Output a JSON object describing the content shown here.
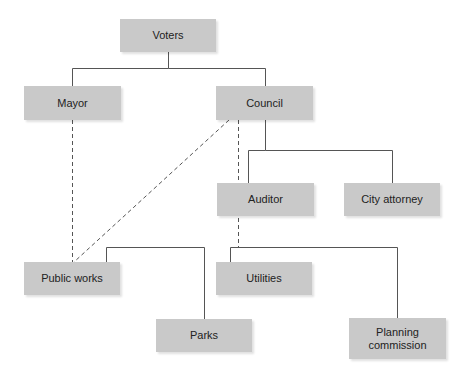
{
  "diagram": {
    "type": "org-chart",
    "nodes": [
      {
        "id": "voters",
        "label": "Voters",
        "x": 120,
        "y": 19,
        "w": 96,
        "h": 33
      },
      {
        "id": "mayor",
        "label": "Mayor",
        "x": 24,
        "y": 86,
        "w": 97,
        "h": 34
      },
      {
        "id": "council",
        "label": "Council",
        "x": 216,
        "y": 86,
        "w": 97,
        "h": 34
      },
      {
        "id": "auditor",
        "label": "Auditor",
        "x": 217,
        "y": 183,
        "w": 97,
        "h": 33
      },
      {
        "id": "city-attorney",
        "label": "City attorney",
        "x": 344,
        "y": 183,
        "w": 96,
        "h": 33
      },
      {
        "id": "public-works",
        "label": "Public works",
        "x": 24,
        "y": 262,
        "w": 96,
        "h": 33
      },
      {
        "id": "utilities",
        "label": "Utilities",
        "x": 216,
        "y": 262,
        "w": 96,
        "h": 33
      },
      {
        "id": "parks",
        "label": "Parks",
        "x": 156,
        "y": 319,
        "w": 96,
        "h": 33
      },
      {
        "id": "planning-commission",
        "label": "Planning commission",
        "x": 349,
        "y": 318,
        "w": 97,
        "h": 41
      }
    ],
    "edges": [
      {
        "from": "voters",
        "to": "mayor",
        "style": "solid"
      },
      {
        "from": "voters",
        "to": "council",
        "style": "solid"
      },
      {
        "from": "council",
        "to": "auditor",
        "style": "solid"
      },
      {
        "from": "council",
        "to": "city-attorney",
        "style": "solid"
      },
      {
        "from": "public-works",
        "to": "parks",
        "style": "solid"
      },
      {
        "from": "utilities",
        "to": "planning-commission",
        "style": "solid"
      },
      {
        "from": "mayor",
        "to": "public-works",
        "style": "dashed"
      },
      {
        "from": "council",
        "to": "public-works",
        "style": "dashed"
      },
      {
        "from": "council",
        "to": "utilities",
        "style": "dashed"
      }
    ]
  },
  "colors": {
    "node_fill": "#c9c9c9",
    "line": "#555555",
    "text": "#222222"
  }
}
